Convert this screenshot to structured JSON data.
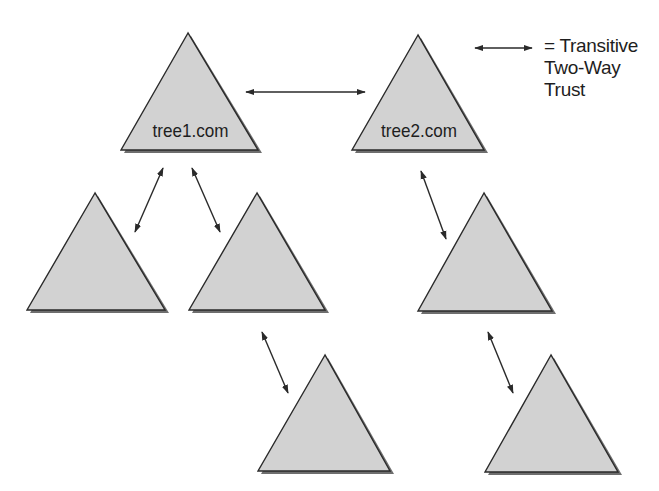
{
  "diagram": {
    "type": "trust-forest",
    "colors": {
      "triangle_fill": "#d2d2d2",
      "triangle_stroke": "#2a2a2a",
      "triangle_shadow": "#6e6e6e",
      "arrow": "#2a2a2a",
      "text": "#1e1e1e",
      "background": "#ffffff"
    },
    "legend": {
      "icon": "double-headed-arrow-icon",
      "lines": [
        "= Transitive",
        "Two-Way",
        "Trust"
      ]
    },
    "trees": [
      {
        "id": "tree1",
        "label": "tree1.com",
        "apex": [
          188,
          33
        ],
        "base_left": [
          121,
          150
        ],
        "base_right": [
          258,
          150
        ],
        "children": [
          "t1c1",
          "t1c2"
        ]
      },
      {
        "id": "tree2",
        "label": "tree2.com",
        "apex": [
          418,
          35
        ],
        "base_left": [
          352,
          150
        ],
        "base_right": [
          484,
          150
        ],
        "children": [
          "t2c1"
        ]
      },
      {
        "id": "t1c1",
        "label": "",
        "apex": [
          95,
          193
        ],
        "base_left": [
          27,
          310
        ],
        "base_right": [
          165,
          310
        ],
        "children": []
      },
      {
        "id": "t1c2",
        "label": "",
        "apex": [
          257,
          193
        ],
        "base_left": [
          189,
          310
        ],
        "base_right": [
          325,
          310
        ],
        "children": [
          "t1c2c1"
        ]
      },
      {
        "id": "t2c1",
        "label": "",
        "apex": [
          484,
          193
        ],
        "base_left": [
          418,
          311
        ],
        "base_right": [
          552,
          311
        ],
        "children": [
          "t2c1c1"
        ]
      },
      {
        "id": "t1c2c1",
        "label": "",
        "apex": [
          325,
          355
        ],
        "base_left": [
          258,
          471
        ],
        "base_right": [
          390,
          471
        ],
        "children": []
      },
      {
        "id": "t2c1c1",
        "label": "",
        "apex": [
          551,
          355
        ],
        "base_left": [
          485,
          472
        ],
        "base_right": [
          618,
          472
        ],
        "children": []
      }
    ],
    "trusts": [
      {
        "from": "tree1",
        "to": "tree2",
        "kind": "transitive-two-way",
        "p1": [
          246,
          92
        ],
        "p2": [
          365,
          92
        ]
      },
      {
        "from": "tree1",
        "to": "t1c1",
        "kind": "transitive-two-way",
        "p1": [
          163,
          168
        ],
        "p2": [
          135,
          232
        ]
      },
      {
        "from": "tree1",
        "to": "t1c2",
        "kind": "transitive-two-way",
        "p1": [
          192,
          168
        ],
        "p2": [
          220,
          232
        ]
      },
      {
        "from": "tree2",
        "to": "t2c1",
        "kind": "transitive-two-way",
        "p1": [
          421,
          171
        ],
        "p2": [
          446,
          239
        ]
      },
      {
        "from": "t1c2",
        "to": "t1c2c1",
        "kind": "transitive-two-way",
        "p1": [
          262,
          332
        ],
        "p2": [
          288,
          393
        ]
      },
      {
        "from": "t2c1",
        "to": "t2c1c1",
        "kind": "transitive-two-way",
        "p1": [
          488,
          332
        ],
        "p2": [
          513,
          393
        ]
      },
      {
        "from": "legend",
        "to": "legend",
        "kind": "legend-sample",
        "p1": [
          475,
          48
        ],
        "p2": [
          532,
          48
        ]
      }
    ]
  }
}
